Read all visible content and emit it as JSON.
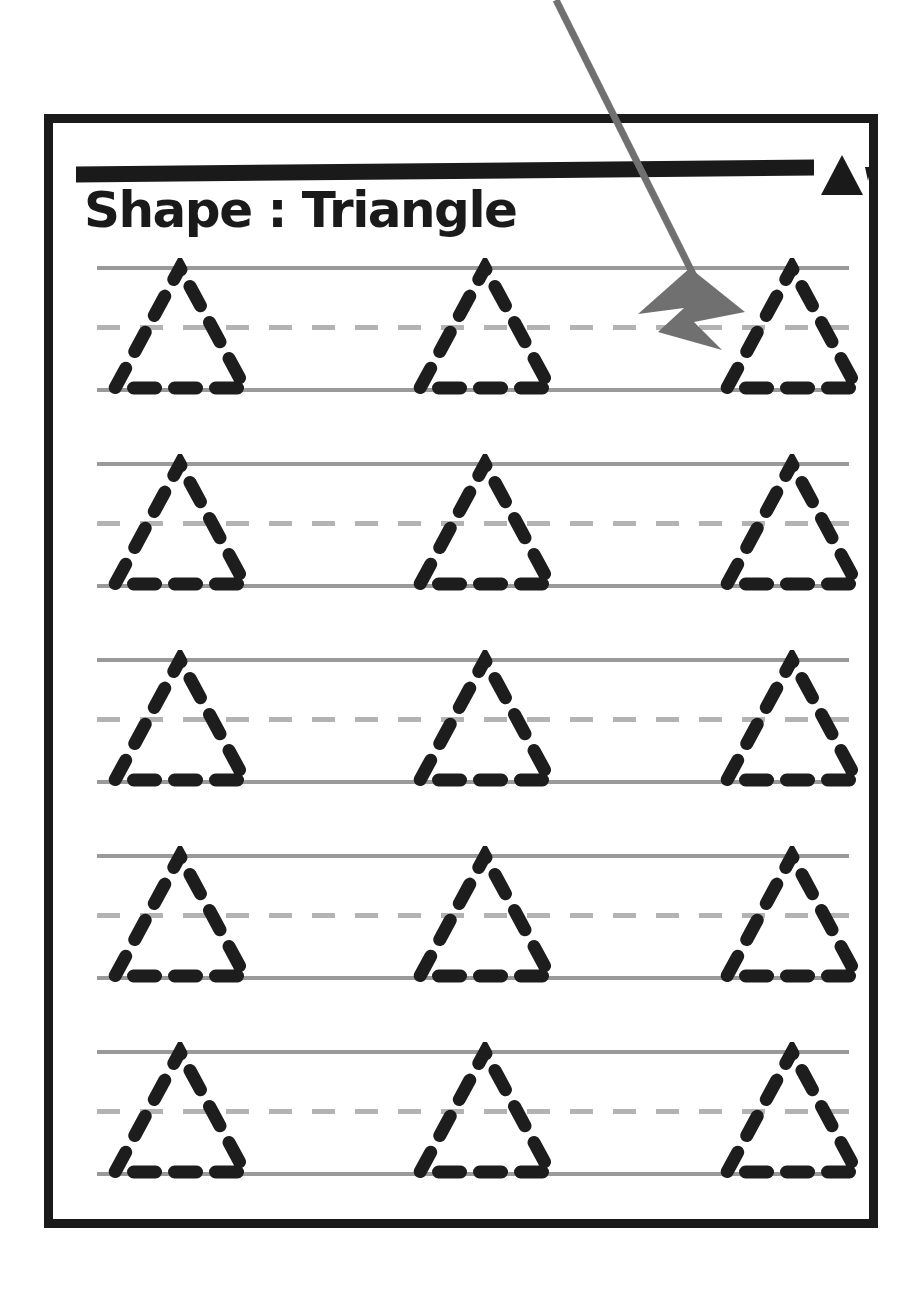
{
  "document": {
    "kind": "handwriting tracing worksheet",
    "title": "Shape : Triangle",
    "header_icon": "triangle-icon",
    "header_icon_accent": "tick-mark-icon",
    "row_count": 5,
    "shapes_per_row": 3,
    "total_shapes": 15
  },
  "colors": {
    "page_border": "#1a1a1a",
    "header_bar": "#1a1a1a",
    "title_text": "#1a1a1a",
    "guide_solid": "#9a9a9a",
    "guide_dashed": "#b3b3b3",
    "trace_stroke": "#1d1d1d",
    "annotation_arrow": "#707070",
    "background": "#ffffff"
  },
  "rows": [
    {
      "index": 1,
      "shapes": [
        "triangle",
        "triangle",
        "triangle"
      ]
    },
    {
      "index": 2,
      "shapes": [
        "triangle",
        "triangle",
        "triangle"
      ]
    },
    {
      "index": 3,
      "shapes": [
        "triangle",
        "triangle",
        "triangle"
      ]
    },
    {
      "index": 4,
      "shapes": [
        "triangle",
        "triangle",
        "triangle"
      ]
    },
    {
      "index": 5,
      "shapes": [
        "triangle",
        "triangle",
        "triangle"
      ]
    }
  ],
  "guides": {
    "top_line_style": "solid",
    "middle_line_style": "dashed",
    "bottom_line_style": "solid"
  },
  "annotation": {
    "type": "arrow",
    "points_to": "third triangle of first row",
    "start": {
      "x": 556,
      "y": 0
    },
    "end": {
      "x": 722,
      "y": 322
    }
  }
}
